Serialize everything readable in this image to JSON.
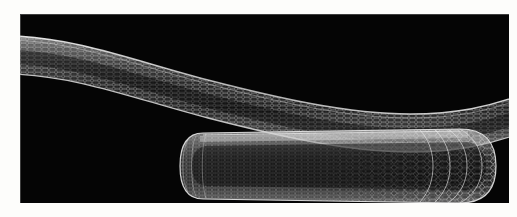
{
  "figure": {
    "caption": "",
    "background_color": "#fdfdfb",
    "canvas_color": "#050505",
    "mesh_color": "#c8c8c8",
    "highlight_color": "#f2f2f2",
    "width_px": 517,
    "height_px": 217
  },
  "canvas": {
    "x": 20,
    "y": 14,
    "width": 489,
    "height": 189,
    "border_color": "#aaaaaa"
  },
  "objects": [
    {
      "id": "upper-nanotube",
      "name": "bent-carbon-nanotube",
      "label": "",
      "shape": "bent-tube",
      "lattice": "hexagonal-graphene",
      "description": "Long flexed single-walled nanotube crossing the full frame with an S-shaped bend",
      "capped": false,
      "path_top": "M -6,22 C 60,24 120,48 190,66 C 260,84 330,100 392,100 C 440,100 470,92 496,82",
      "path_bottom": "M -6,58 C 60,60 120,84 190,102 C 260,120 330,136 392,136 C 440,136 470,128 496,118",
      "diameter_px": 36,
      "ring_count": 132,
      "brightness": 0.72
    },
    {
      "id": "lower-nanotube",
      "name": "capped-carbon-nanotube",
      "label": "",
      "shape": "capsule-tube",
      "lattice": "hexagonal-graphene",
      "description": "Capped nanotube seen in perspective; hemispherical cap at left, rounded open-end cap at right",
      "capped": true,
      "axis_y": 152,
      "x_left": 165,
      "x_right": 476,
      "radius_left": 19,
      "radius_right": 37,
      "ring_count": 86,
      "brightness": 0.8
    }
  ],
  "render": {
    "style": "wireframe-mesh",
    "lighting": "edge-highlight",
    "perspective": "true"
  }
}
